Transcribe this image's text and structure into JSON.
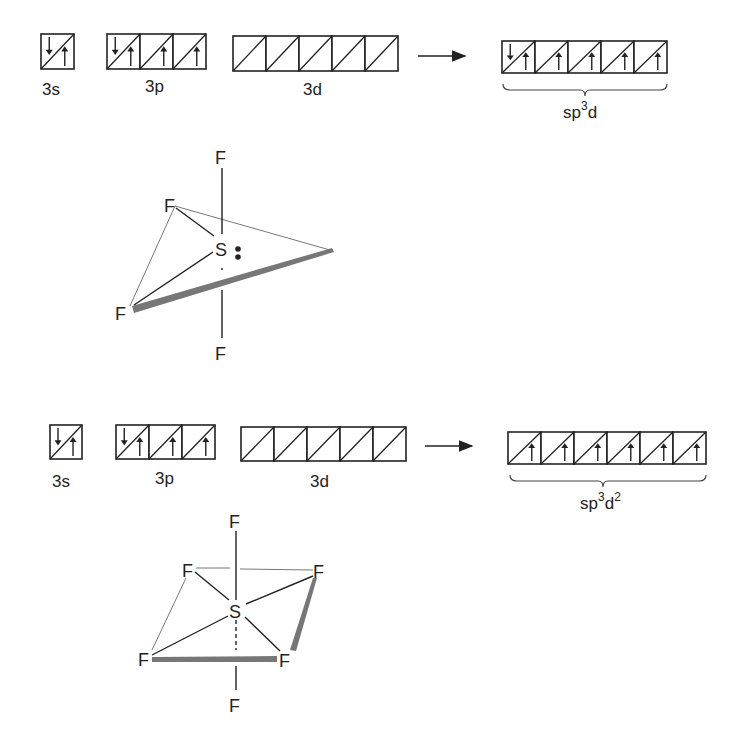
{
  "sf4": {
    "orbitals": {
      "s": {
        "label": "3s",
        "boxes": [
          [
            "down",
            "up"
          ]
        ]
      },
      "p": {
        "label": "3p",
        "boxes": [
          [
            "down",
            "up"
          ],
          [
            "up"
          ],
          [
            "up"
          ]
        ]
      },
      "d": {
        "label": "3d",
        "boxes": [
          [],
          [],
          [],
          [],
          []
        ]
      },
      "hybrid": {
        "label_base": "sp",
        "label_sup": "3",
        "label_tail": "d",
        "label_sup2": "",
        "boxes": [
          [
            "down",
            "up"
          ],
          [
            "up"
          ],
          [
            "up"
          ],
          [
            "up"
          ],
          [
            "up"
          ]
        ]
      }
    },
    "molecule": {
      "central": "S",
      "lone_pair": ":",
      "atoms": [
        "F",
        "F",
        "F",
        "F"
      ]
    }
  },
  "sf6": {
    "orbitals": {
      "s": {
        "label": "3s",
        "boxes": [
          [
            "down",
            "up"
          ]
        ]
      },
      "p": {
        "label": "3p",
        "boxes": [
          [
            "down",
            "up"
          ],
          [
            "up"
          ],
          [
            "up"
          ]
        ]
      },
      "d": {
        "label": "3d",
        "boxes": [
          [],
          [],
          [],
          [],
          []
        ]
      },
      "hybrid": {
        "label_base": "sp",
        "label_sup": "3",
        "label_tail": "d",
        "label_sup2": "2",
        "boxes": [
          [
            "up"
          ],
          [
            "up"
          ],
          [
            "up"
          ],
          [
            "up"
          ],
          [
            "up"
          ],
          [
            "up"
          ]
        ]
      }
    },
    "molecule": {
      "central": "S",
      "atoms": [
        "F",
        "F",
        "F",
        "F",
        "F",
        "F"
      ]
    }
  },
  "colors": {
    "ink": "#222222",
    "wedge": "#777777",
    "background": "#ffffff"
  }
}
